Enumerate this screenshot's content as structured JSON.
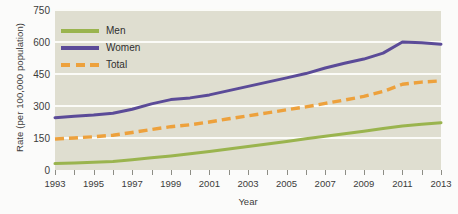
{
  "chart_data": {
    "type": "line",
    "title": "",
    "xlabel": "Year",
    "ylabel": "Rate (per 100,000 population)",
    "xlim": [
      1993,
      2013
    ],
    "ylim": [
      0,
      750
    ],
    "yticks": [
      0,
      150,
      300,
      450,
      600,
      750
    ],
    "ytick_labels": [
      "0",
      "150",
      "300",
      "450",
      "600",
      "750"
    ],
    "x": [
      1993,
      1994,
      1995,
      1996,
      1997,
      1998,
      1999,
      2000,
      2001,
      2002,
      2003,
      2004,
      2005,
      2006,
      2007,
      2008,
      2009,
      2010,
      2011,
      2012,
      2013
    ],
    "xtick_labels": [
      "1993",
      "1995",
      "1997",
      "1999",
      "2001",
      "2003",
      "2005",
      "2007",
      "2009",
      "2011",
      "2013"
    ],
    "xtick_labeled_years": [
      1993,
      1995,
      1997,
      1999,
      2001,
      2003,
      2005,
      2007,
      2009,
      2011,
      2013
    ],
    "grid": "horizontal",
    "legend_position": "upper-left-inside",
    "series": [
      {
        "name": "Men",
        "color": "#9ab44e",
        "style": "solid",
        "values": [
          30,
          33,
          36,
          40,
          48,
          57,
          66,
          76,
          87,
          98,
          110,
          122,
          134,
          146,
          158,
          170,
          182,
          194,
          206,
          214,
          222
        ]
      },
      {
        "name": "Women",
        "color": "#5b4b98",
        "style": "solid",
        "values": [
          245,
          252,
          258,
          266,
          285,
          310,
          330,
          338,
          352,
          372,
          392,
          412,
          432,
          452,
          478,
          500,
          520,
          548,
          600,
          596,
          590
        ]
      },
      {
        "name": "Total",
        "color": "#eda13c",
        "style": "dashed",
        "values": [
          145,
          150,
          156,
          163,
          176,
          190,
          203,
          212,
          225,
          240,
          254,
          268,
          282,
          296,
          312,
          328,
          345,
          368,
          402,
          412,
          418
        ]
      }
    ]
  },
  "legend": {
    "items": [
      {
        "label": "Men"
      },
      {
        "label": "Women"
      },
      {
        "label": "Total"
      }
    ]
  },
  "axes": {
    "y_title": "Rate (per 100,000 population)",
    "x_title": "Year"
  }
}
